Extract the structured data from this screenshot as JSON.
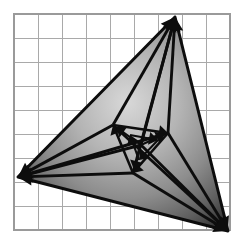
{
  "figure": {
    "canvas": {
      "width": 243,
      "height": 251
    },
    "background_color": "#ffffff"
  },
  "grid": {
    "name": "square-grid",
    "origin_x": 14,
    "origin_y": 14,
    "cell_size": 24,
    "columns": 9,
    "rows": 9,
    "line_color": "#a9a9a9",
    "border_color": "#9a9a9a",
    "line_width": 1,
    "visible": true
  },
  "colors": {
    "stroke": "#0d0d0d",
    "gradient_light": "#cfcfcf",
    "gradient_mid": "#9a9a9a",
    "gradient_dark": "#4a4a4a",
    "gradient_edge": "#2b2b2b",
    "grid_line": "#a9a9a9"
  },
  "shapes": {
    "outer_triangle": {
      "name": "outer-triangle",
      "vertices": [
        {
          "label": "A",
          "x": 175,
          "y": 17
        },
        {
          "label": "B",
          "x": 18,
          "y": 177
        },
        {
          "label": "C",
          "x": 228,
          "y": 231
        }
      ],
      "fill": "radial-gradient",
      "stroke_width": 3
    },
    "mid_triangle": {
      "name": "mid-triangle",
      "vertices": [
        {
          "label": "A1",
          "x": 113,
          "y": 125
        },
        {
          "label": "B1",
          "x": 168,
          "y": 133
        },
        {
          "label": "C1",
          "x": 133,
          "y": 173
        }
      ],
      "stroke_width": 2.6
    },
    "inner_triangle": {
      "name": "inner-triangle",
      "vertices": [
        {
          "label": "A2",
          "x": 130,
          "y": 135
        },
        {
          "label": "B2",
          "x": 158,
          "y": 140
        },
        {
          "label": "C2",
          "x": 139,
          "y": 160
        }
      ],
      "stroke_width": 2.2
    },
    "center_hub": {
      "name": "center-hub",
      "x": 141,
      "y": 145
    }
  },
  "gradient": {
    "name": "radial-shading",
    "center_x_pct": 52,
    "center_y_pct": 40,
    "radius_pct": 72,
    "stops": [
      {
        "offset": 0,
        "color": "#d8d8d8"
      },
      {
        "offset": 35,
        "color": "#b4b4b4"
      },
      {
        "offset": 62,
        "color": "#8d8d8d"
      },
      {
        "offset": 85,
        "color": "#5e5e5e"
      },
      {
        "offset": 100,
        "color": "#343434"
      }
    ]
  },
  "arrows": {
    "head_length": 13,
    "head_width": 9,
    "small_head_length": 9,
    "small_head_width": 6.5,
    "items": [
      {
        "name": "arrow-hub-to-apex-top",
        "from": [
          141,
          145
        ],
        "to": [
          175,
          17
        ],
        "head": "large",
        "group": "outer"
      },
      {
        "name": "arrow-midA-to-apex-top",
        "from": [
          113,
          125
        ],
        "to": [
          175,
          17
        ],
        "head": "large",
        "group": "outer"
      },
      {
        "name": "arrow-midB-to-apex-top",
        "from": [
          168,
          133
        ],
        "to": [
          175,
          17
        ],
        "head": "large",
        "group": "outer"
      },
      {
        "name": "arrow-midC-to-apex-top",
        "from": [
          133,
          173
        ],
        "to": [
          175,
          17
        ],
        "head": "large",
        "group": "outer"
      },
      {
        "name": "arrow-hub-to-apex-left",
        "from": [
          141,
          145
        ],
        "to": [
          18,
          177
        ],
        "head": "large",
        "group": "outer"
      },
      {
        "name": "arrow-midA-to-apex-left",
        "from": [
          113,
          125
        ],
        "to": [
          18,
          177
        ],
        "head": "large",
        "group": "outer"
      },
      {
        "name": "arrow-midB-to-apex-left",
        "from": [
          168,
          133
        ],
        "to": [
          18,
          177
        ],
        "head": "large",
        "group": "outer"
      },
      {
        "name": "arrow-midC-to-apex-left",
        "from": [
          133,
          173
        ],
        "to": [
          18,
          177
        ],
        "head": "large",
        "group": "outer"
      },
      {
        "name": "arrow-hub-to-apex-right",
        "from": [
          141,
          145
        ],
        "to": [
          228,
          231
        ],
        "head": "large",
        "group": "outer"
      },
      {
        "name": "arrow-midA-to-apex-right",
        "from": [
          113,
          125
        ],
        "to": [
          228,
          231
        ],
        "head": "large",
        "group": "outer"
      },
      {
        "name": "arrow-midB-to-apex-right",
        "from": [
          168,
          133
        ],
        "to": [
          228,
          231
        ],
        "head": "large",
        "group": "outer"
      },
      {
        "name": "arrow-midC-to-apex-right",
        "from": [
          133,
          173
        ],
        "to": [
          228,
          231
        ],
        "head": "large",
        "group": "outer"
      },
      {
        "name": "arrow-mid-edge-ab",
        "from": [
          113,
          125
        ],
        "to": [
          168,
          133
        ],
        "head": "small",
        "group": "mid"
      },
      {
        "name": "arrow-mid-edge-bc",
        "from": [
          168,
          133
        ],
        "to": [
          133,
          173
        ],
        "head": "small",
        "group": "mid"
      },
      {
        "name": "arrow-mid-edge-ca",
        "from": [
          133,
          173
        ],
        "to": [
          113,
          125
        ],
        "head": "small",
        "group": "mid"
      },
      {
        "name": "arrow-inner-edge-ab",
        "from": [
          130,
          135
        ],
        "to": [
          158,
          140
        ],
        "head": "small",
        "group": "inner"
      },
      {
        "name": "arrow-inner-edge-bc",
        "from": [
          158,
          140
        ],
        "to": [
          139,
          160
        ],
        "head": "small",
        "group": "inner"
      },
      {
        "name": "arrow-inner-edge-ca",
        "from": [
          139,
          160
        ],
        "to": [
          130,
          135
        ],
        "head": "small",
        "group": "inner"
      },
      {
        "name": "arrow-hub-to-midA",
        "from": [
          141,
          145
        ],
        "to": [
          116,
          127
        ],
        "head": "small",
        "group": "spoke"
      },
      {
        "name": "arrow-hub-to-midB",
        "from": [
          141,
          145
        ],
        "to": [
          165,
          134
        ],
        "head": "small",
        "group": "spoke"
      },
      {
        "name": "arrow-hub-to-midC",
        "from": [
          141,
          145
        ],
        "to": [
          134,
          170
        ],
        "head": "small",
        "group": "spoke"
      }
    ]
  }
}
